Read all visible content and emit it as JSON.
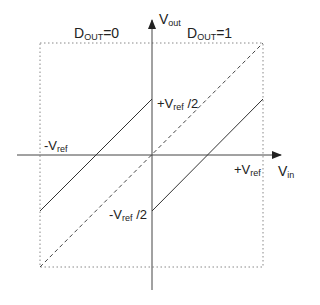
{
  "diagram": {
    "colors": {
      "line": "#333333",
      "axis": "#444444",
      "box": "#888888"
    },
    "labels": {
      "dout0": {
        "main": "D",
        "sub": "OUT",
        "suffix": "=0"
      },
      "dout1": {
        "main": "D",
        "sub": "OUT",
        "suffix": "=1"
      },
      "vout": {
        "main": "V",
        "sub": "out"
      },
      "vin": {
        "main": "V",
        "sub": "in"
      },
      "neg_vref": {
        "main": "-V",
        "sub": "ref",
        "suffix": ""
      },
      "pos_vref": {
        "main": "+V",
        "sub": "ref",
        "suffix": ""
      },
      "pos_vref_half": {
        "main": "+V",
        "sub": "ref",
        "suffix": " /2"
      },
      "neg_vref_half": {
        "main": "-V",
        "sub": "ref",
        "suffix": " /2"
      }
    },
    "elements": {
      "dotted_box": {
        "x1": 40,
        "y1": 43,
        "x2": 263,
        "y2": 267
      },
      "x_axis": {
        "x1": 17,
        "x2": 283,
        "y": 155
      },
      "y_axis": {
        "x": 152,
        "y1": 290,
        "y2": 20
      },
      "solid_line_dout0": {
        "x1": 40,
        "y1": 211,
        "x2": 152,
        "y2": 99
      },
      "solid_line_dout1": {
        "x1": 152,
        "y1": 211,
        "x2": 263,
        "y2": 99
      },
      "dashed_ideal_line": {
        "x1": 40,
        "y1": 267,
        "x2": 263,
        "y2": 43
      }
    }
  }
}
